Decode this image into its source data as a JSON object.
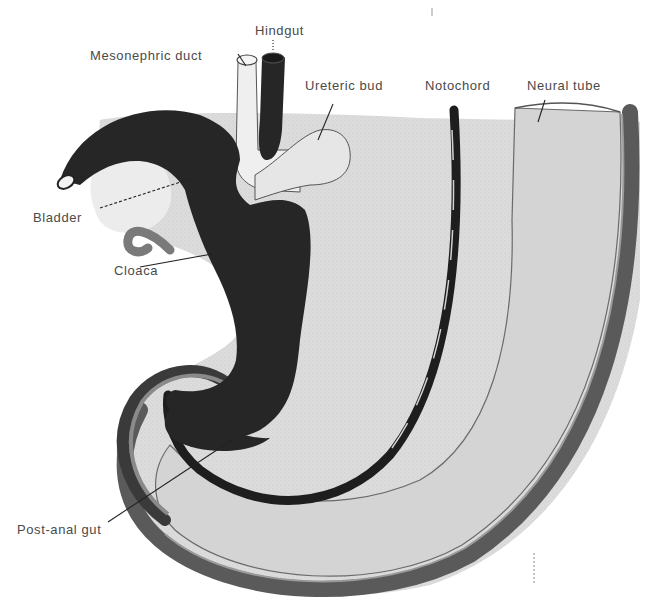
{
  "figure": {
    "background": "#ffffff",
    "colors": {
      "label_text": "#4a4a4a",
      "gut_dark": "#262626",
      "neural_tube_fill": "#d6d6d6",
      "neural_tube_wall": "#5a5a5a",
      "mesoderm_fill": "#e4e4e4",
      "light_tissue": "#ececec",
      "allantois_gray": "#7a7a7a",
      "notochord": "#1e1e1e"
    }
  },
  "labels": [
    {
      "id": "hindgut",
      "text": "Hindgut",
      "x": 255,
      "y": 24
    },
    {
      "id": "mesonephric-duct",
      "text": "Mesonephric duct",
      "x": 90,
      "y": 49
    },
    {
      "id": "ureteric-bud",
      "text": "Ureteric bud",
      "x": 305,
      "y": 79
    },
    {
      "id": "notochord",
      "text": "Notochord",
      "x": 425,
      "y": 79
    },
    {
      "id": "neural-tube",
      "text": "Neural tube",
      "x": 527,
      "y": 79
    },
    {
      "id": "bladder",
      "text": "Bladder",
      "x": 33,
      "y": 211
    },
    {
      "id": "cloaca",
      "text": "Cloaca",
      "x": 114,
      "y": 264
    },
    {
      "id": "post-anal-gut",
      "text": "Post-anal gut",
      "x": 17,
      "y": 523
    }
  ]
}
